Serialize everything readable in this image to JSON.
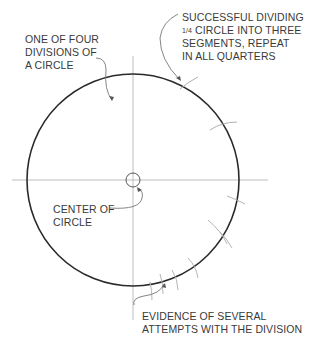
{
  "diagram": {
    "colors": {
      "circle": "#2a2a2a",
      "construction": "#b8b8b8",
      "leader": "#777777",
      "text": "#3a3a3a"
    },
    "circle": {
      "cx": 133,
      "cy": 180,
      "r": 106
    },
    "center_mark": {
      "cx": 133,
      "cy": 180,
      "r": 7
    },
    "labels": {
      "one_of_four": {
        "lines": [
          "ONE OF FOUR",
          "DIVISIONS OF",
          "A CIRCLE"
        ]
      },
      "successful": {
        "lines": [
          "SUCCESSFUL DIVIDING",
          "CIRCLE INTO THREE",
          "SEGMENTS, REPEAT",
          "IN ALL QUARTERS"
        ],
        "fraction": "1/4"
      },
      "center": {
        "lines": [
          "CENTER OF",
          "CIRCLE"
        ]
      },
      "evidence": {
        "lines": [
          "EVIDENCE OF SEVERAL",
          "ATTEMPTS WITH THE DIVISION"
        ]
      }
    }
  }
}
